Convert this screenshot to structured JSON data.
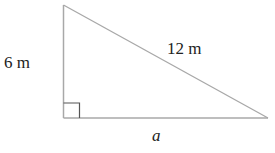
{
  "diagram": {
    "type": "right-triangle",
    "stroke_color": "#a8a8a8",
    "text_color": "#222222",
    "labels": {
      "vertical_leg": "6 m",
      "hypotenuse": "12 m",
      "horizontal_leg": "a"
    },
    "right_angle_marker": true
  }
}
